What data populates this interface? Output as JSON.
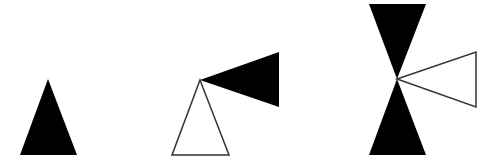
{
  "colors": {
    "background": "#ffffff",
    "fill": "#000000",
    "outline": "#333333"
  },
  "figures": [
    {
      "name": "figure-1",
      "shapes": [
        {
          "type": "filled-triangle",
          "points": "48,79 20,155 77,155"
        }
      ]
    },
    {
      "name": "figure-2",
      "shapes": [
        {
          "type": "outline-triangle",
          "points": "200,80 172,155 229,155"
        },
        {
          "type": "filled-triangle",
          "points": "200,80 279,52 279,107"
        }
      ]
    },
    {
      "name": "figure-3",
      "shapes": [
        {
          "type": "filled-triangle",
          "points": "397,79 369,4 426,4"
        },
        {
          "type": "filled-triangle",
          "points": "397,79 369,155 426,155"
        },
        {
          "type": "outline-triangle",
          "points": "397,79 476,52 476,107"
        }
      ]
    }
  ]
}
